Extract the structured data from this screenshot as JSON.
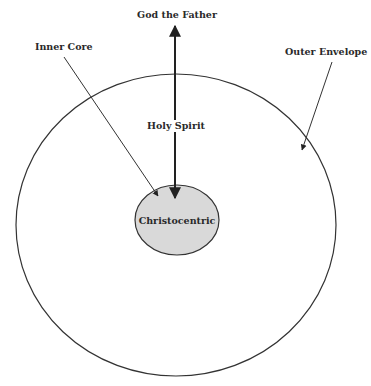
{
  "diagram": {
    "labels": {
      "top": "God the Father",
      "inner_core": "Inner Core",
      "outer_envelope": "Outer Envelope",
      "holy_spirit": "Holy Spirit",
      "center": "Christocentric"
    },
    "colors": {
      "stroke": "#333333",
      "inner_fill": "#d9d9d9",
      "background": "#ffffff"
    }
  }
}
